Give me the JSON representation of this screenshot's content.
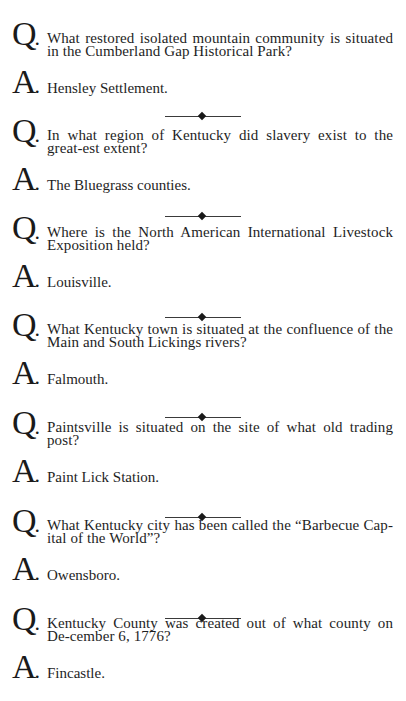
{
  "page": {
    "q_label": "Q",
    "a_label": "A",
    "items": [
      {
        "question": "What restored isolated mountain community is situated in the Cumberland Gap Historical Park?",
        "answer": "Hensley Settlement."
      },
      {
        "question": "In what region of Kentucky did slavery exist to the great-est extent?",
        "answer": "The Bluegrass counties."
      },
      {
        "question": "Where is the North American International Livestock Exposition held?",
        "answer": "Louisville."
      },
      {
        "question": "What Kentucky town is situated at the confluence of the Main and South Lickings rivers?",
        "answer": "Falmouth."
      },
      {
        "question": "Paintsville is situated on the site of what old trading post?",
        "answer": "Paint Lick Station."
      },
      {
        "question": "What Kentucky city has been called the “Barbecue Cap-ital of the World”?",
        "answer": "Owensboro."
      },
      {
        "question": "Kentucky County was created out of what county on De-cember 6, 1776?",
        "answer": "Fincastle."
      }
    ]
  }
}
